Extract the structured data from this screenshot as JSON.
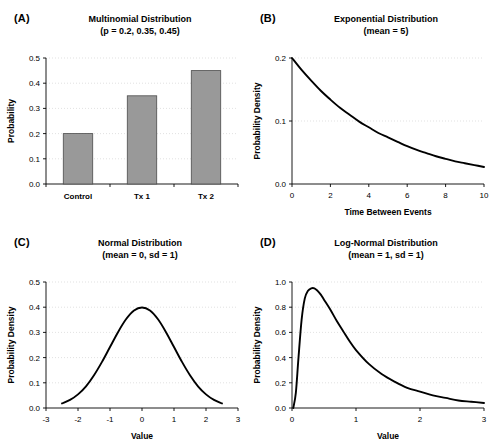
{
  "figure": {
    "panels": [
      {
        "letter": "(A)",
        "title": "Multinomial Distribution",
        "subtitle": "(p = 0.2, 0.35, 0.45)"
      },
      {
        "letter": "(B)",
        "title": "Exponential Distribution",
        "subtitle": "(mean = 5)"
      },
      {
        "letter": "(C)",
        "title": "Normal Distribution",
        "subtitle": "(mean = 0, sd = 1)"
      },
      {
        "letter": "(D)",
        "title": "Log-Normal Distribution",
        "subtitle": "(mean = 1, sd = 1)"
      }
    ]
  },
  "style": {
    "bar_fill": "#999999",
    "bar_stroke": "#4d4d4d",
    "curve_color": "#000000",
    "axis_color": "#000000",
    "grid_color": "#cccccc"
  },
  "chart_data": [
    {
      "panel": "A",
      "type": "bar",
      "title": "Multinomial Distribution",
      "subtitle": "(p = 0.2, 0.35, 0.45)",
      "xlabel": "",
      "ylabel": "Probability",
      "categories": [
        "Control",
        "Tx 1",
        "Tx 2"
      ],
      "values": [
        0.2,
        0.35,
        0.45
      ],
      "ylim": [
        0.0,
        0.5
      ],
      "yticks": [
        0.0,
        0.1,
        0.2,
        0.3,
        0.4,
        0.5
      ],
      "ytick_labels": [
        "0.0",
        "0.1",
        "0.2",
        "0.3",
        "0.4",
        "0.5"
      ],
      "grid": true,
      "legend": "none"
    },
    {
      "panel": "B",
      "type": "line",
      "title": "Exponential Distribution",
      "subtitle": "(mean = 5)",
      "xlabel": "Time Between Events",
      "ylabel": "Probability Density",
      "xlim": [
        0,
        10
      ],
      "ylim": [
        0.0,
        0.2
      ],
      "xticks": [
        0,
        2,
        4,
        6,
        8,
        10
      ],
      "xtick_labels": [
        "0",
        "2",
        "4",
        "6",
        "8",
        "10"
      ],
      "yticks": [
        0.0,
        0.1,
        0.2
      ],
      "ytick_labels": [
        "0.0",
        "0.1",
        "0.2"
      ],
      "grid": true,
      "legend": "none",
      "rate": 0.2,
      "x": [
        0,
        0.5,
        1,
        1.5,
        2,
        2.5,
        3,
        3.5,
        4,
        4.5,
        5,
        5.5,
        6,
        6.5,
        7,
        7.5,
        8,
        8.5,
        9,
        9.5,
        10
      ],
      "y": [
        0.2,
        0.181,
        0.164,
        0.148,
        0.134,
        0.121,
        0.11,
        0.099,
        0.09,
        0.081,
        0.074,
        0.067,
        0.06,
        0.054,
        0.049,
        0.044,
        0.04,
        0.036,
        0.033,
        0.03,
        0.027
      ]
    },
    {
      "panel": "C",
      "type": "line",
      "title": "Normal Distribution",
      "subtitle": "(mean = 0, sd = 1)",
      "xlabel": "Value",
      "ylabel": "Probability Density",
      "xlim": [
        -3,
        3
      ],
      "ylim": [
        0.0,
        0.5
      ],
      "xticks": [
        -3,
        -2,
        -1,
        0,
        1,
        2,
        3
      ],
      "xtick_labels": [
        "-3",
        "-2",
        "-1",
        "0",
        "1",
        "2",
        "3"
      ],
      "yticks": [
        0.0,
        0.1,
        0.2,
        0.3,
        0.4,
        0.5
      ],
      "ytick_labels": [
        "0.0",
        "0.1",
        "0.2",
        "0.3",
        "0.4",
        "0.5"
      ],
      "grid": true,
      "legend": "none",
      "mean": 0,
      "sd": 1,
      "x": [
        -2.5,
        -2.25,
        -2,
        -1.75,
        -1.5,
        -1.25,
        -1,
        -0.75,
        -0.5,
        -0.25,
        0,
        0.25,
        0.5,
        0.75,
        1,
        1.25,
        1.5,
        1.75,
        2,
        2.25,
        2.5
      ],
      "y": [
        0.018,
        0.032,
        0.054,
        0.086,
        0.13,
        0.183,
        0.242,
        0.301,
        0.352,
        0.387,
        0.399,
        0.387,
        0.352,
        0.301,
        0.242,
        0.183,
        0.13,
        0.086,
        0.054,
        0.032,
        0.018
      ]
    },
    {
      "panel": "D",
      "type": "line",
      "title": "Log-Normal Distribution",
      "subtitle": "(mean = 1, sd = 1)",
      "xlabel": "Value",
      "ylabel": "Probability Density",
      "xlim": [
        0,
        3
      ],
      "ylim": [
        0.0,
        1.0
      ],
      "xticks": [
        0,
        1,
        2,
        3
      ],
      "xtick_labels": [
        "0",
        "1",
        "2",
        "3"
      ],
      "yticks": [
        0.0,
        0.2,
        0.4,
        0.6,
        0.8,
        1.0
      ],
      "ytick_labels": [
        "0.0",
        "0.2",
        "0.4",
        "0.6",
        "0.8",
        "1.0"
      ],
      "grid": true,
      "legend": "none",
      "peak_x": 0.38,
      "peak_y": 0.95,
      "x": [
        0.02,
        0.06,
        0.1,
        0.15,
        0.2,
        0.25,
        0.3,
        0.35,
        0.4,
        0.45,
        0.5,
        0.6,
        0.7,
        0.8,
        0.9,
        1.0,
        1.2,
        1.4,
        1.6,
        1.8,
        2.0,
        2.2,
        2.4,
        2.6,
        2.8,
        3.0
      ],
      "y": [
        0.0,
        0.12,
        0.39,
        0.7,
        0.87,
        0.93,
        0.95,
        0.95,
        0.93,
        0.9,
        0.86,
        0.78,
        0.69,
        0.61,
        0.53,
        0.46,
        0.35,
        0.27,
        0.21,
        0.16,
        0.13,
        0.1,
        0.08,
        0.06,
        0.05,
        0.04
      ]
    }
  ]
}
